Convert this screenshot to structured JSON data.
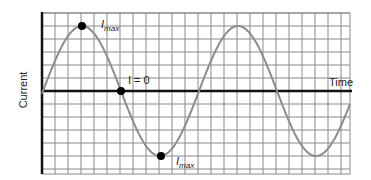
{
  "figure": {
    "type": "sine-wave-diagram",
    "ylabel": "Current",
    "xlabel": "Time",
    "annotations": {
      "max_top": {
        "symbol": "I",
        "subscript": "max"
      },
      "zero": {
        "text": "I = 0"
      },
      "max_bottom": {
        "symbol": "I",
        "subscript": "max"
      }
    },
    "colors": {
      "grid": "#8a8a8a",
      "axis": "#111111",
      "curve": "#8c8c8c",
      "marker": "#000000"
    }
  },
  "chart_data": {
    "type": "line",
    "title": "",
    "xlabel": "Time",
    "ylabel": "Current",
    "grid": true,
    "series": [
      {
        "name": "Current",
        "function": "sine"
      }
    ],
    "marked_points": [
      {
        "label": "Imax",
        "position": "positive peak"
      },
      {
        "label": "I = 0",
        "position": "zero crossing"
      },
      {
        "label": "Imax",
        "position": "negative peak"
      }
    ]
  }
}
